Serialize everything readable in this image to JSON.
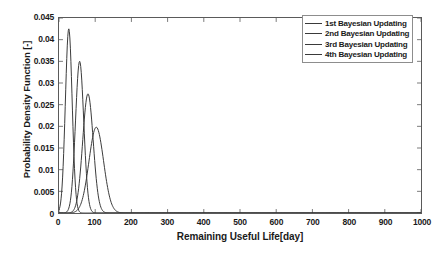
{
  "chart_data": {
    "type": "line",
    "title": "",
    "xlabel": "Remaining Useful Life[day]",
    "ylabel": "Probability Density Function [-]",
    "xlim": [
      0,
      1000
    ],
    "ylim": [
      0,
      0.045
    ],
    "xticks": [
      0,
      100,
      200,
      300,
      400,
      500,
      600,
      700,
      800,
      900,
      1000
    ],
    "xtick_labels": [
      "0",
      "100",
      "200",
      "300",
      "400",
      "500",
      "600",
      "700",
      "800",
      "900",
      "1000"
    ],
    "yticks": [
      0,
      0.005,
      0.01,
      0.015,
      0.02,
      0.025,
      0.03,
      0.035,
      0.04,
      0.045
    ],
    "ytick_labels": [
      "0",
      "0.005",
      "0.01",
      "0.015",
      "0.02",
      "0.025",
      "0.03",
      "0.035",
      "0.04",
      "0.045"
    ],
    "grid": false,
    "legend_position": "upper right",
    "series": [
      {
        "name": "1st Bayesian Updating",
        "color": "#3a3a3a",
        "peak_x": 27,
        "peak_y": 0.0425,
        "sigma": 9.4
      },
      {
        "name": "2nd Bayesian Updating",
        "color": "#3a3a3a",
        "peak_x": 57,
        "peak_y": 0.035,
        "sigma": 11.4
      },
      {
        "name": "3rd Bayesian Updating",
        "color": "#3a3a3a",
        "peak_x": 80,
        "peak_y": 0.0275,
        "sigma": 14.5
      },
      {
        "name": "4th Bayesian Updating",
        "color": "#3a3a3a",
        "peak_x": 103,
        "peak_y": 0.0198,
        "sigma": 20.1
      }
    ]
  },
  "legend": {
    "items": [
      {
        "label": "1st Bayesian Updating"
      },
      {
        "label": "2nd Bayesian Updating"
      },
      {
        "label": "3rd Bayesian Updating"
      },
      {
        "label": "4th Bayesian Updating"
      }
    ]
  }
}
